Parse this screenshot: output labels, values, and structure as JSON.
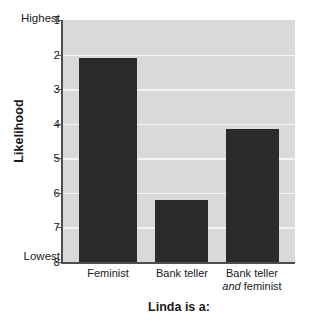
{
  "chart_data": {
    "type": "bar",
    "title": "",
    "xlabel": "Linda is a:",
    "ylabel": "Likelihood",
    "categories": [
      "Feminist",
      "Bank teller",
      "Bank teller and feminist"
    ],
    "values": [
      2.1,
      6.2,
      4.15
    ],
    "ylim": [
      1,
      8
    ],
    "y_inverted": true,
    "y_ticks": [
      1,
      2,
      3,
      4,
      5,
      6,
      7,
      8
    ],
    "y_tick_labels": [
      "1",
      "2",
      "3",
      "4",
      "5",
      "6",
      "7",
      "8"
    ],
    "y_axis_high_label": "Highest",
    "y_axis_low_label": "Lowest",
    "grid": true,
    "legend": "none",
    "series": [
      {
        "name": "Likelihood rating",
        "values": [
          2.1,
          6.2,
          4.15
        ]
      }
    ],
    "colors": {
      "bar": "#2b2b2b",
      "plot_background": "#d9d9d9",
      "gridline": "#f4f4f4",
      "axis": "#4d4d4d",
      "text": "#1a1a1a",
      "page_background": "#ffffff"
    }
  },
  "axis": {
    "y_title": "Likelihood",
    "x_title": "Linda is a:",
    "highest_label": "Highest",
    "lowest_label": "Lowest",
    "ticks": [
      "1",
      "2",
      "3",
      "4",
      "5",
      "6",
      "7",
      "8"
    ]
  },
  "bars": [
    {
      "label": "Feminist",
      "label_line1": "Feminist",
      "label_line2": "",
      "value": 2.1
    },
    {
      "label": "Bank teller",
      "label_line1": "Bank teller",
      "label_line2": "",
      "value": 6.2
    },
    {
      "label": "Bank teller and feminist",
      "label_line1": "Bank teller",
      "label_line2_italic": "and",
      "label_line2_rest": " feminist",
      "value": 4.15
    }
  ]
}
